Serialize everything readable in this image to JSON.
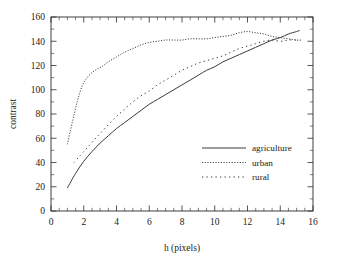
{
  "chart_data": {
    "type": "line",
    "title": "",
    "xlabel": "h (pixels)",
    "ylabel": "contrast",
    "xlim": [
      0,
      16
    ],
    "ylim": [
      0,
      160
    ],
    "xticks": [
      0,
      2,
      4,
      6,
      8,
      10,
      12,
      14,
      16
    ],
    "xticklabels": [
      "0",
      "2",
      "4",
      "6",
      "8",
      "10",
      "12",
      "14",
      "16"
    ],
    "yticks": [
      0,
      20,
      40,
      60,
      80,
      100,
      120,
      140,
      160
    ],
    "yticklabels": [
      "0",
      "20",
      "40",
      "60",
      "80",
      "100",
      "120",
      "140",
      "160"
    ],
    "xminor_step": 0.5,
    "yminor_step": 10,
    "grid": false,
    "legend_position": "center-right",
    "series": [
      {
        "name": "agriculture",
        "style": "solid",
        "color": "#3a3a3a",
        "x": [
          1.0,
          1.5,
          2.0,
          2.5,
          3.0,
          3.5,
          4.0,
          4.5,
          5.0,
          5.5,
          6.0,
          6.5,
          7.0,
          7.5,
          8.0,
          8.5,
          9.0,
          9.5,
          10.0,
          10.5,
          11.0,
          11.5,
          12.0,
          12.5,
          13.0,
          13.5,
          14.0,
          14.5,
          15.0,
          15.2
        ],
        "y": [
          19,
          31,
          41,
          49,
          56,
          62,
          68,
          73,
          78,
          83,
          88,
          92,
          96,
          100,
          104,
          108,
          112,
          116,
          119,
          123,
          126,
          129,
          132,
          135,
          138,
          141,
          143,
          146,
          148,
          149
        ]
      },
      {
        "name": "urban",
        "style": "dotted",
        "color": "#3a3a3a",
        "x": [
          1.0,
          1.3,
          1.6,
          1.9,
          2.2,
          2.5,
          2.8,
          3.1,
          3.5,
          4.0,
          4.5,
          5.0,
          5.5,
          6.0,
          6.5,
          7.0,
          7.5,
          8.0,
          8.5,
          9.0,
          9.5,
          10.0,
          10.5,
          11.0,
          11.5,
          12.0,
          12.5,
          13.0,
          13.5,
          14.0,
          14.5,
          15.0,
          15.3
        ],
        "y": [
          55,
          73,
          90,
          103,
          110,
          114,
          117,
          119,
          123,
          127,
          131,
          134,
          137,
          139,
          140,
          141,
          141,
          141,
          142,
          142,
          142,
          143,
          144,
          145,
          147,
          148,
          147,
          146,
          144,
          143,
          142,
          141,
          141
        ]
      },
      {
        "name": "rural",
        "style": "dashed",
        "color": "#3a3a3a",
        "x": [
          1.4,
          1.8,
          2.2,
          2.6,
          3.0,
          3.5,
          4.0,
          4.5,
          5.0,
          5.5,
          6.0,
          6.5,
          7.0,
          7.5,
          8.0,
          8.5,
          9.0,
          9.5,
          10.0,
          10.5,
          11.0,
          11.5,
          12.0,
          12.5,
          13.0,
          13.5,
          14.0,
          14.5,
          15.0
        ],
        "y": [
          40,
          46,
          52,
          58,
          64,
          71,
          78,
          84,
          90,
          95,
          99,
          104,
          108,
          112,
          116,
          119,
          122,
          124,
          126,
          128,
          131,
          134,
          136,
          138,
          140,
          141,
          140,
          141,
          141
        ]
      }
    ],
    "legend": [
      {
        "label": "agriculture",
        "style": "solid"
      },
      {
        "label": "urban",
        "style": "dotted"
      },
      {
        "label": "rural",
        "style": "dashed"
      }
    ]
  }
}
